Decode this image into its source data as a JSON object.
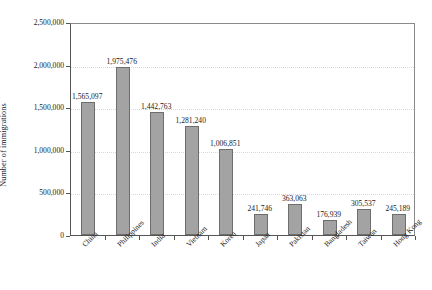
{
  "chart_data": {
    "type": "bar",
    "title": "",
    "subtitle": "",
    "xlabel": "",
    "ylabel": "Number of immigrations",
    "ylim": [
      0,
      2500000
    ],
    "grid": true,
    "legend": false,
    "legend_position": "none",
    "bar_color": "#a3a3a3",
    "bar_border_color": "#6e6e6e",
    "categories": [
      "China",
      "Philippines",
      "India",
      "Vietnam",
      "Korea",
      "Japan",
      "Pakistan",
      "Bangladesh",
      "Taiwan",
      "Hong Kong"
    ],
    "values": [
      1565097,
      1975476,
      1442763,
      1281240,
      1006851,
      241746,
      363063,
      176939,
      305537,
      245189
    ],
    "value_labels": [
      "1,565,097",
      "1,975,476",
      "1,442,763",
      "1,281,240",
      "1,006,851",
      "241,746",
      "363,063",
      "176,939",
      "305,537",
      "245,189"
    ],
    "yticks": [
      0,
      500000,
      1000000,
      1500000,
      2000000,
      2500000
    ],
    "ytick_labels": [
      "0",
      "500,000",
      "1,000,000",
      "1,500,000",
      "2,000,000",
      "2,500,000"
    ]
  }
}
